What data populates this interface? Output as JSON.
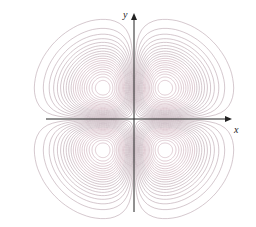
{
  "figure": {
    "x_axis_label": "x",
    "y_axis_label": "y"
  },
  "colors": {
    "contour": "#b9a3ad",
    "contour_inner": "#c9a9b5",
    "axis": "#222222",
    "background": "#ffffff"
  },
  "chart_data": {
    "type": "contour",
    "title": "",
    "xlabel": "x",
    "ylabel": "y",
    "lobes": [
      {
        "quadrant": "upper-left",
        "center": [
          -1,
          1
        ]
      },
      {
        "quadrant": "upper-right",
        "center": [
          1,
          1
        ]
      },
      {
        "quadrant": "lower-left",
        "center": [
          -1,
          -1
        ]
      },
      {
        "quadrant": "lower-right",
        "center": [
          1,
          -1
        ]
      }
    ],
    "contour_levels_per_lobe": 20,
    "grid": false,
    "legend": false
  },
  "layout": {
    "origin_px": [
      134,
      119
    ],
    "lobe_offset_px": 31,
    "x_axis_range_px": [
      46,
      232
    ],
    "y_axis_range_px": [
      12,
      212
    ]
  }
}
